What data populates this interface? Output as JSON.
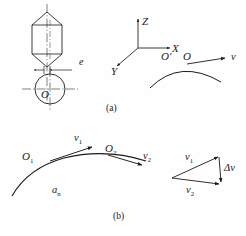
{
  "figure": {
    "background_color": "#fefefe",
    "ink_color": "#1a1a1a",
    "width": 246,
    "height": 236,
    "panels": [
      {
        "id": "a",
        "caption": "(a)"
      },
      {
        "id": "b",
        "caption": "(b)"
      }
    ]
  },
  "panel_a": {
    "caption": "(a)",
    "eccentricity_label": "e",
    "circle_center_label": "O",
    "axes": {
      "z_label": "Z",
      "x_label": "X",
      "y_label": "Y"
    },
    "path": {
      "point_prime_label": "O′",
      "point_label": "O",
      "velocity_label": "v"
    }
  },
  "panel_b": {
    "caption": "(b)",
    "point_1_label": "O",
    "point_1_sub": "1",
    "point_2_label": "O",
    "point_2_sub": "2",
    "velocity_1_label": "v",
    "velocity_1_sub": "1",
    "velocity_2_label": "v",
    "velocity_2_sub": "2",
    "normal_accel_label": "a",
    "normal_accel_sub": "n",
    "triangle": {
      "v1_label": "v",
      "v1_sub": "1",
      "v2_label": "v",
      "v2_sub": "2",
      "delta_v_label": "Δv"
    }
  }
}
